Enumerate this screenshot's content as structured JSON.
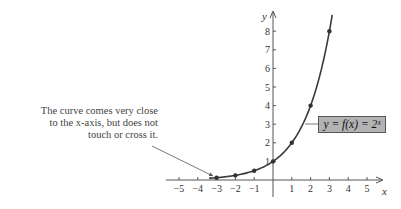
{
  "chart_data": {
    "type": "line",
    "title": "",
    "xlabel": "x",
    "ylabel": "y",
    "xlim": [
      -5,
      5
    ],
    "ylim": [
      0,
      8
    ],
    "grid": false,
    "x_ticks": [
      "-5",
      "-4",
      "-3",
      "-2",
      "-1",
      "1",
      "2",
      "3",
      "4",
      "5"
    ],
    "y_ticks": [
      "1",
      "2",
      "3",
      "4",
      "5",
      "6",
      "7",
      "8"
    ],
    "series": [
      {
        "name": "y = f(x) = 2^x",
        "points": [
          {
            "x": -3,
            "y": 0.125
          },
          {
            "x": -2,
            "y": 0.25
          },
          {
            "x": -1,
            "y": 0.5
          },
          {
            "x": 0,
            "y": 1
          },
          {
            "x": 1,
            "y": 2
          },
          {
            "x": 2,
            "y": 4
          },
          {
            "x": 3,
            "y": 8
          }
        ],
        "curve_domain": [
          -3.4,
          3.15
        ]
      }
    ],
    "annotations": [
      {
        "text": "The curve comes very close to the x-axis, but does not touch or cross it.",
        "points_to": {
          "x": -3.2,
          "y": 0.2
        }
      },
      {
        "text": "y = f(x) = 2^x",
        "type": "function-label",
        "points_to": {
          "x": 1.7,
          "y": 3
        }
      }
    ]
  },
  "labels": {
    "x_axis": "x",
    "y_axis": "y",
    "annotation_line1": "The curve comes very close",
    "annotation_line2": "to the x-axis, but does not",
    "annotation_line3": "touch or cross it.",
    "function_label": "y = f(x) = 2ˣ"
  },
  "colors": {
    "curve": "#3a3a3a",
    "axis": "#555555",
    "label_box": "#b3b3b3",
    "text": "#444444"
  }
}
